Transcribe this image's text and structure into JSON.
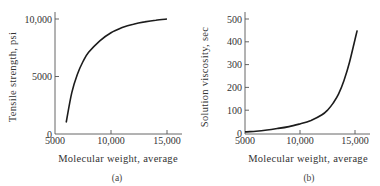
{
  "chart_data": [
    {
      "type": "line",
      "title": "",
      "caption": "(a)",
      "xlabel": "Molecular weight, average",
      "ylabel": "Tensile strength, psi",
      "xlim": [
        5000,
        16000
      ],
      "ylim": [
        0,
        10500
      ],
      "x_ticks": [
        5000,
        10000,
        15000
      ],
      "x_tick_labels": [
        "5000",
        "10,000",
        "15,000"
      ],
      "y_ticks": [
        0,
        5000,
        10000
      ],
      "y_tick_labels": [
        "0",
        "5000",
        "10,000"
      ],
      "grid": false,
      "legend": null,
      "series": [
        {
          "name": "Tensile strength",
          "x": [
            6000,
            6500,
            7000,
            7500,
            8000,
            9000,
            10000,
            11000,
            12000,
            13000,
            14000,
            15000
          ],
          "y": [
            1000,
            3600,
            5200,
            6300,
            7100,
            8100,
            8800,
            9250,
            9550,
            9750,
            9900,
            10000
          ]
        }
      ]
    },
    {
      "type": "line",
      "title": "",
      "caption": "(b)",
      "xlabel": "Molecular weight, average",
      "ylabel": "Solution viscosity, sec",
      "xlim": [
        5000,
        16000
      ],
      "ylim": [
        0,
        530
      ],
      "x_ticks": [
        5000,
        10000,
        15000
      ],
      "x_tick_labels": [
        "5000",
        "10,000",
        "15,000"
      ],
      "y_ticks": [
        0,
        100,
        200,
        300,
        400,
        500
      ],
      "y_tick_labels": [
        "0",
        "100",
        "200",
        "300",
        "400",
        "500"
      ],
      "grid": false,
      "legend": null,
      "series": [
        {
          "name": "Solution viscosity",
          "x": [
            5000,
            6000,
            7000,
            8000,
            9000,
            10000,
            11000,
            12000,
            12500,
            13000,
            13500,
            14000,
            14500,
            15000,
            15200
          ],
          "y": [
            5,
            8,
            13,
            20,
            28,
            40,
            55,
            80,
            100,
            130,
            170,
            230,
            310,
            410,
            450
          ]
        }
      ]
    }
  ]
}
